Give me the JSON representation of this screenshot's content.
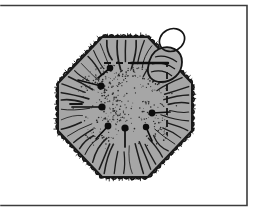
{
  "figure": {
    "caption": "",
    "background_color": "#ffffff",
    "frame": {
      "name": "plate-border",
      "stroke_color": "#3c3c3c",
      "stroke_width": 1.6,
      "left": 1,
      "top": 5.5,
      "right": 247,
      "bottom": 205.5,
      "left_edge_visible": false
    },
    "specimen": {
      "name": "octagonal-cell-body",
      "fill_color": "#a6a6a6",
      "outline_color": "#1a1a1a",
      "outline_width": 2.0,
      "shape": "octagon",
      "center_x": 125,
      "center_y": 107,
      "radius_x": 67,
      "radius_y": 70,
      "corner_cut": 0.34
    },
    "fringe": {
      "name": "ciliated-margin",
      "description": "scalloped fringed border with short radiating hairs",
      "color": "#141414",
      "scallop_count": 72,
      "scallop_depth": 3.0
    },
    "radiating_lines": {
      "name": "radial-striation",
      "color": "#1c1c1c",
      "count": 46,
      "inner_fraction": 0.52,
      "outer_fraction": 0.95,
      "width": 1.15
    },
    "stipple": {
      "name": "stipple-texture",
      "color": "#2a2a2a",
      "count": 420,
      "dot_radius": 0.55,
      "cluster_count": 13
    },
    "pins": {
      "name": "pin-marker",
      "head_color": "#0d0d0d",
      "stem_color": "#0d0d0d",
      "stem_width": 1.7,
      "items": [
        {
          "head_x": 110,
          "head_y": 68,
          "head_r": 3.3,
          "tail_x": 98,
          "tail_y": 78
        },
        {
          "head_x": 101,
          "head_y": 86,
          "head_r": 3.6,
          "tail_x": 78,
          "tail_y": 80
        },
        {
          "head_x": 102,
          "head_y": 107,
          "head_r": 3.6,
          "tail_x": 72,
          "tail_y": 107
        },
        {
          "head_x": 108,
          "head_y": 126,
          "head_r": 3.4,
          "tail_x": 96,
          "tail_y": 139
        },
        {
          "head_x": 125,
          "head_y": 128,
          "head_r": 3.6,
          "tail_x": 125,
          "tail_y": 147
        },
        {
          "head_x": 146,
          "head_y": 127,
          "head_r": 3.2,
          "tail_x": 152,
          "tail_y": 141
        },
        {
          "head_x": 152,
          "head_y": 113,
          "head_r": 3.4,
          "tail_x": 170,
          "tail_y": 112
        }
      ]
    },
    "dashed_outline": {
      "name": "dashed-inner-boundary",
      "color": "#141414",
      "width": 1.8,
      "dash": "7 5",
      "points": "104,63 131,63 167,63 167,100 167,135"
    },
    "solid_segment": {
      "name": "solid-boundary-segment",
      "color": "#0d0d0d",
      "width": 2.4,
      "x1": 131,
      "y1": 63,
      "x2": 168,
      "y2": 63
    },
    "short_tick": {
      "name": "margin-tick",
      "color": "#141414",
      "width": 1.8,
      "x1": 70,
      "y1": 104,
      "x2": 82,
      "y2": 104
    },
    "loop": {
      "name": "apical-loop",
      "color": "#141414",
      "width": 1.7,
      "cx": 172,
      "cy": 40,
      "rx": 13,
      "ry": 11,
      "rotation": -28
    },
    "lobe": {
      "name": "overlapping-lobe",
      "fill_color": "#a6a6a6",
      "outline_color": "#141414",
      "width": 1.8
    }
  }
}
